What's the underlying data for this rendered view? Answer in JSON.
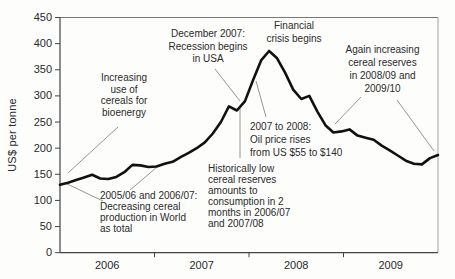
{
  "chart_data": {
    "type": "line",
    "title": "",
    "xlabel": "",
    "ylabel": "US$ per tonne",
    "x_description": "monthly, January 2006 - December 2009",
    "x_tick_labels": [
      "2006",
      "2007",
      "2008",
      "2009"
    ],
    "y_ticks": [
      0,
      50,
      100,
      150,
      200,
      250,
      300,
      350,
      400,
      450
    ],
    "ylim": [
      0,
      450
    ],
    "grid": false,
    "legend": "none",
    "line_color": "#111111",
    "series": [
      {
        "name": "cereal price (US$ per tonne)",
        "values": [
          130,
          134,
          139,
          144,
          149,
          142,
          141,
          145,
          154,
          168,
          167,
          164,
          165,
          170,
          174,
          183,
          191,
          200,
          211,
          228,
          250,
          280,
          272,
          290,
          330,
          368,
          386,
          372,
          344,
          312,
          294,
          300,
          270,
          244,
          230,
          232,
          236,
          224,
          220,
          216,
          205,
          196,
          186,
          176,
          170,
          169,
          181,
          187
        ]
      }
    ],
    "annotations": [
      {
        "id": "bioenergy",
        "text": "Increasing\nuse of\ncereals for\nbioenergy",
        "align": "center",
        "box": {
          "left": 79,
          "top": 72,
          "width": 90,
          "lh": 11.5
        },
        "leaders": [
          [
            118,
            127,
            68,
            173
          ]
        ]
      },
      {
        "id": "recession",
        "text": "December 2007:\nRecession begins\nin USA",
        "align": "center",
        "box": {
          "left": 158,
          "top": 28,
          "width": 100,
          "lh": 12.5
        },
        "leaders": [
          [
            215,
            69,
            240,
            101
          ]
        ]
      },
      {
        "id": "financial-crisis",
        "text": "Financial\ncrisis begins",
        "align": "center",
        "box": {
          "left": 254,
          "top": 19,
          "width": 80,
          "lh": 13
        },
        "leaders": []
      },
      {
        "id": "again-increasing",
        "text": "Again increasing\ncereal reserves\nin 2008/09 and\n2009/10",
        "align": "center",
        "box": {
          "left": 334,
          "top": 43,
          "width": 97,
          "lh": 13
        },
        "leaders": [
          [
            361,
            97,
            335,
            124
          ],
          [
            397,
            100,
            434,
            151
          ]
        ]
      },
      {
        "id": "oil-price",
        "text": "2007 to 2008:\nOil price rises\nfrom US $55 to $140",
        "align": "left",
        "box": {
          "left": 250,
          "top": 120,
          "width": 105,
          "lh": 13
        },
        "leaders": [
          [
            266,
            117,
            256,
            81
          ]
        ]
      },
      {
        "id": "low-reserves",
        "text": "Historically low\ncereal reserves\namounts to\nconsumption in 2\nmonths in 2006/07\nand 2007/08",
        "align": "left",
        "box": {
          "left": 208,
          "top": 163,
          "width": 95,
          "lh": 11
        },
        "leaders": [
          [
            240,
            158,
            240,
            107
          ]
        ]
      },
      {
        "id": "decreasing-production",
        "text": "2005/06 and 2006/07:\nDecreasing cereal\nproduction in World\nas total",
        "align": "left",
        "box": {
          "left": 100,
          "top": 190,
          "width": 120,
          "lh": 11
        },
        "leaders": [
          [
            103,
            201,
            65,
            183
          ],
          [
            130,
            190,
            157,
            167
          ]
        ]
      }
    ],
    "layout": {
      "plot_left": 60,
      "plot_right": 438,
      "plot_top": 17.5,
      "plot_bottom": 252.7,
      "axis_color": "#444444",
      "box_top_color": "#777777",
      "box_right_color": "#b0b0b0",
      "leader_color": "#8a8a8a",
      "tick_label_color": "#2a2a2a"
    }
  }
}
